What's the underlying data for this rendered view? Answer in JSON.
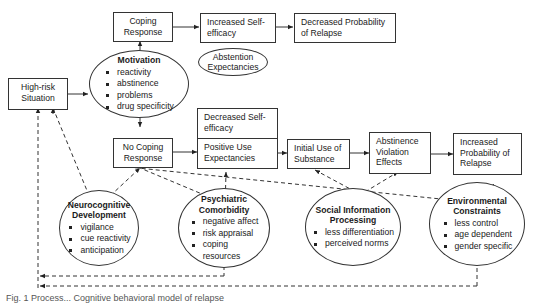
{
  "diagram": {
    "nodes": {
      "high_risk": "High-risk Situation",
      "coping_response": "Coping Response",
      "increased_self_efficacy": "Increased Self-efficacy",
      "decreased_probability": "Decreased Probability of Relapse",
      "abstention_expectancies": "Abstention Expectancies",
      "no_coping_response": "No Coping Response",
      "decreased_self_efficacy": "Decreased Self-efficacy",
      "positive_use_expectancies": "Positive Use Expectancies",
      "initial_use": "Initial Use of Substance",
      "abstinence_violation": "Abstinence Violation Effects",
      "increased_probability": "Increased Probability of Relapse"
    },
    "motivation": {
      "title": "Motivation",
      "items": [
        "reactivity",
        "abstinence",
        "problems",
        "drug specificity"
      ]
    },
    "neurocognitive": {
      "title": "Neurocognitive Development",
      "items": [
        "vigilance",
        "cue reactivity",
        "anticipation"
      ]
    },
    "psychiatric": {
      "title": "Psychiatric Comorbidity",
      "items": [
        "negative affect",
        "risk appraisal",
        "coping resources"
      ]
    },
    "social": {
      "title": "Social Information Processing",
      "items": [
        "less differentiation",
        "perceived norms"
      ]
    },
    "environmental": {
      "title": "Environmental Constraints",
      "items": [
        "less control",
        "age dependent",
        "gender specific"
      ]
    },
    "caption": "Fig. 1 Process... Cognitive behavioral model of relapse"
  }
}
